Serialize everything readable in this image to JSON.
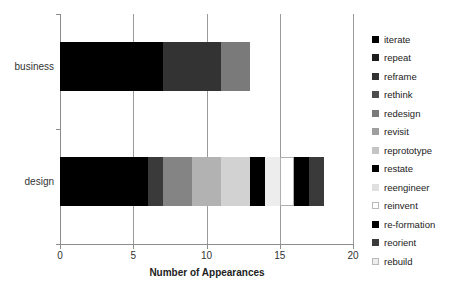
{
  "chart_data": {
    "type": "bar",
    "orientation": "horizontal",
    "stacked": true,
    "title": "",
    "xlabel": "Number of Appearances",
    "ylabel": "",
    "xlim": [
      0,
      20
    ],
    "xticks": [
      "0",
      "5",
      "10",
      "15",
      "20"
    ],
    "xtick_values": [
      0,
      5,
      10,
      15,
      20
    ],
    "grid": true,
    "grid_axis": "x",
    "legend_position": "right",
    "categories": [
      "business",
      "design"
    ],
    "series": [
      {
        "name": "iterate",
        "color": "#000000",
        "values": [
          7,
          6
        ]
      },
      {
        "name": "repeat",
        "color": "#1c1c1c",
        "values": [
          0,
          1
        ]
      },
      {
        "name": "reframe",
        "color": "#333333",
        "values": [
          4,
          0
        ]
      },
      {
        "name": "rethink",
        "color": "#4d4d4d",
        "values": [
          0,
          2
        ]
      },
      {
        "name": "redesign",
        "color": "#7a7a7a",
        "values": [
          2,
          2
        ]
      },
      {
        "name": "revisit",
        "color": "#9e9e9e",
        "values": [
          0,
          2
        ]
      },
      {
        "name": "reprototype",
        "color": "#c4c4c4",
        "values": [
          0,
          0
        ]
      },
      {
        "name": "restate",
        "color": "#000000",
        "values": [
          0,
          1
        ]
      },
      {
        "name": "reengineer",
        "color": "#e0e0e0",
        "values": [
          0,
          1
        ]
      },
      {
        "name": "reinvent",
        "color": "#ffffff",
        "values": [
          0,
          1
        ]
      },
      {
        "name": "re-formation",
        "color": "#000000",
        "values": [
          0,
          1
        ]
      },
      {
        "name": "reorient",
        "color": "#3a3a3a",
        "values": [
          0,
          1
        ]
      },
      {
        "name": "rebuild",
        "color": "#ededed",
        "values": [
          0,
          0
        ]
      }
    ],
    "totals": {
      "business": 13,
      "design": 18
    },
    "bars": [
      {
        "category": "business",
        "segments": [
          {
            "series": "iterate",
            "start": 0,
            "end": 7,
            "color": "#000000"
          },
          {
            "series": "reframe",
            "start": 7,
            "end": 11,
            "color": "#333333"
          },
          {
            "series": "redesign",
            "start": 11,
            "end": 13,
            "color": "#7a7a7a"
          }
        ]
      },
      {
        "category": "design",
        "segments": [
          {
            "series": "iterate",
            "start": 0,
            "end": 6,
            "color": "#000000"
          },
          {
            "series": "repeat",
            "start": 6,
            "end": 7,
            "color": "#3a3a3a"
          },
          {
            "series": "rethink",
            "start": 7,
            "end": 9,
            "color": "#848484"
          },
          {
            "series": "redesign",
            "start": 9,
            "end": 11,
            "color": "#b2b2b2"
          },
          {
            "series": "revisit",
            "start": 11,
            "end": 13,
            "color": "#d2d2d2"
          },
          {
            "series": "restate",
            "start": 13,
            "end": 14,
            "color": "#000000"
          },
          {
            "series": "reengineer",
            "start": 14,
            "end": 15,
            "color": "#ededed"
          },
          {
            "series": "reinvent",
            "start": 15,
            "end": 16,
            "color": "#ffffff"
          },
          {
            "series": "re-formation",
            "start": 16,
            "end": 17,
            "color": "#000000"
          },
          {
            "series": "reorient",
            "start": 17,
            "end": 18,
            "color": "#3a3a3a"
          }
        ]
      }
    ]
  },
  "axis": {
    "x_title": "Number of Appearances",
    "x_labels": [
      "0",
      "5",
      "10",
      "15",
      "20"
    ],
    "y_labels": [
      "business",
      "design"
    ]
  },
  "legend": {
    "items": [
      {
        "label": "iterate",
        "color": "#000000",
        "outlined": false
      },
      {
        "label": "repeat",
        "color": "#1c1c1c",
        "outlined": false
      },
      {
        "label": "reframe",
        "color": "#333333",
        "outlined": false
      },
      {
        "label": "rethink",
        "color": "#4d4d4d",
        "outlined": false
      },
      {
        "label": "redesign",
        "color": "#7a7a7a",
        "outlined": false
      },
      {
        "label": "revisit",
        "color": "#9e9e9e",
        "outlined": false
      },
      {
        "label": "reprototype",
        "color": "#c4c4c4",
        "outlined": false
      },
      {
        "label": "restate",
        "color": "#000000",
        "outlined": false
      },
      {
        "label": "reengineer",
        "color": "#e0e0e0",
        "outlined": false
      },
      {
        "label": "reinvent",
        "color": "#ffffff",
        "outlined": true
      },
      {
        "label": "re-formation",
        "color": "#000000",
        "outlined": false
      },
      {
        "label": "reorient",
        "color": "#3a3a3a",
        "outlined": false
      },
      {
        "label": "rebuild",
        "color": "#ededed",
        "outlined": true
      }
    ]
  }
}
